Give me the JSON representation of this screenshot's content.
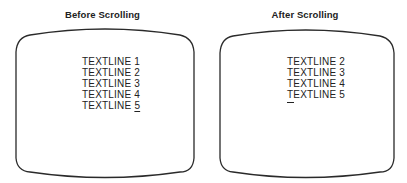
{
  "panels": [
    {
      "title": "Before Scrolling",
      "lines": [
        "TEXTLINE 1",
        "TEXTLINE 2",
        "TEXTLINE 3",
        "TEXTLINE 4"
      ],
      "last_line_prefix": "TEXTLINE ",
      "last_line_cursor_char": "5",
      "cursor_position": "under character '5' on TEXTLINE 5"
    },
    {
      "title": "After Scrolling",
      "lines": [
        "TEXTLINE 2",
        "TEXTLINE 3",
        "TEXTLINE 4",
        "TEXTLINE 5"
      ],
      "cursor_position": "new empty line below TEXTLINE 5"
    }
  ],
  "colors": {
    "outline": "#2a2a2a",
    "text": "#222222",
    "background": "#ffffff"
  }
}
